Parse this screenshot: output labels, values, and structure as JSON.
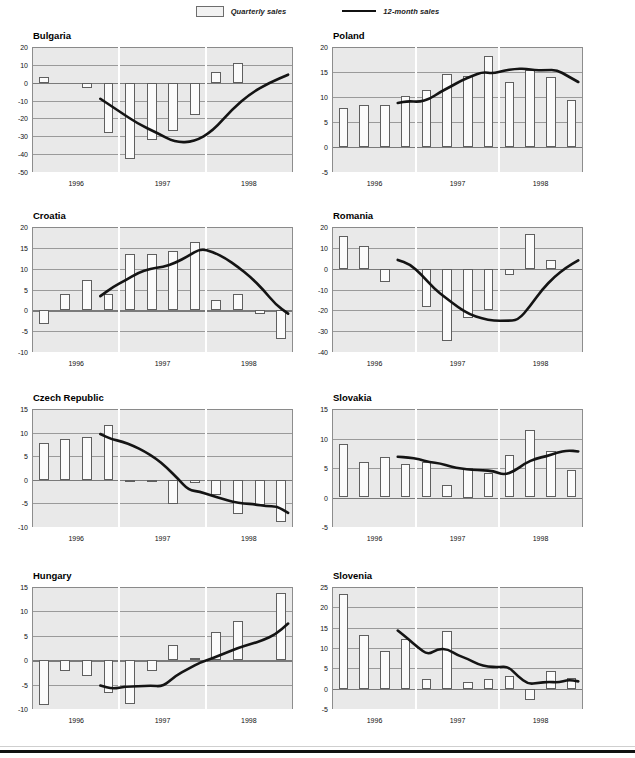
{
  "legend": {
    "items": [
      {
        "name": "bar-swatch",
        "label": "Quarterly sales"
      },
      {
        "name": "line-swatch",
        "label": "12-month sales"
      }
    ]
  },
  "xaxis": {
    "year_labels": [
      "1996",
      "1997",
      "1998"
    ]
  },
  "chart_data": [
    {
      "type": "bar",
      "id": "bulgaria",
      "title": "Bulgaria",
      "xlabel": "",
      "ylabel": "",
      "ylim": [
        -50,
        20
      ],
      "yticks": [
        20,
        10,
        0,
        -10,
        -20,
        -30,
        -40,
        -50
      ],
      "ytick_labels": [
        "20",
        "10",
        "0",
        "-10",
        "-20",
        "-30",
        "-40",
        "-50"
      ],
      "grid": true,
      "legend_position": "top-center",
      "categories": [
        "1996Q1",
        "1996Q2",
        "1996Q3",
        "1996Q4",
        "1997Q1",
        "1997Q2",
        "1997Q3",
        "1997Q4",
        "1998Q1",
        "1998Q2",
        "1998Q3",
        "1998Q4"
      ],
      "series": [
        {
          "name": "Quarterly sales",
          "type": "bar",
          "values": [
            3.0,
            0.0,
            -3.0,
            -28.0,
            -43.0,
            -32.0,
            -27.0,
            -18.0,
            6.0,
            11.0,
            0.0,
            0.0
          ]
        },
        {
          "name": "12-month sales",
          "type": "line",
          "x": [
            "1996Q4",
            "1997Q1",
            "1997Q2",
            "1997Q3",
            "1997Q4",
            "1998Q1",
            "1998Q2",
            "1998Q3",
            "1998Q4"
          ],
          "values": [
            -9.0,
            -16.0,
            -23.0,
            -28.0,
            -33.5,
            -33.0,
            -27.0,
            -15.0,
            -6.0,
            0.0,
            4.5
          ]
        }
      ]
    },
    {
      "type": "bar",
      "id": "poland",
      "title": "Poland",
      "xlabel": "",
      "ylabel": "",
      "ylim": [
        -5,
        20
      ],
      "yticks": [
        20,
        15,
        10,
        5,
        0,
        -5
      ],
      "ytick_labels": [
        "20",
        "15",
        "10",
        "5",
        "0",
        "-5"
      ],
      "grid": true,
      "legend_position": "top-center",
      "categories": [
        "1996Q1",
        "1996Q2",
        "1996Q3",
        "1996Q4",
        "1997Q1",
        "1997Q2",
        "1997Q3",
        "1997Q4",
        "1998Q1",
        "1998Q2",
        "1998Q3",
        "1998Q4"
      ],
      "series": [
        {
          "name": "Quarterly sales",
          "type": "bar",
          "values": [
            7.8,
            8.5,
            8.4,
            10.3,
            11.5,
            14.7,
            14.3,
            18.3,
            13.0,
            15.5,
            14.1,
            9.5
          ]
        },
        {
          "name": "12-month sales",
          "type": "line",
          "values": [
            8.8,
            9.2,
            9.0,
            9.6,
            11.0,
            12.1,
            13.3,
            14.2,
            15.0,
            14.7,
            15.3,
            15.6,
            15.7,
            15.3,
            15.4,
            15.4,
            14.2,
            13.0
          ]
        }
      ]
    },
    {
      "type": "bar",
      "id": "croatia",
      "title": "Croatia",
      "xlabel": "",
      "ylabel": "",
      "ylim": [
        -10,
        20
      ],
      "yticks": [
        20,
        15,
        10,
        5,
        0,
        -5,
        -10
      ],
      "ytick_labels": [
        "20",
        "15",
        "10",
        "5",
        "0",
        "-5",
        "-10"
      ],
      "grid": true,
      "legend_position": "top-center",
      "categories": [
        "1996Q1",
        "1996Q2",
        "1996Q3",
        "1996Q4",
        "1997Q1",
        "1997Q2",
        "1997Q3",
        "1997Q4",
        "1998Q1",
        "1998Q2",
        "1998Q3",
        "1998Q4"
      ],
      "series": [
        {
          "name": "Quarterly sales",
          "type": "bar",
          "values": [
            -3.2,
            4.0,
            7.4,
            4.0,
            13.5,
            13.6,
            14.2,
            16.5,
            2.4,
            3.9,
            -0.8,
            -6.8
          ]
        },
        {
          "name": "12-month sales",
          "type": "line",
          "values": [
            3.4,
            5.6,
            7.2,
            9.0,
            10.0,
            10.4,
            11.4,
            13.0,
            14.8,
            14.0,
            12.5,
            10.4,
            8.0,
            5.0,
            1.4,
            -0.8
          ]
        }
      ]
    },
    {
      "type": "bar",
      "id": "romania",
      "title": "Romania",
      "xlabel": "",
      "ylabel": "",
      "ylim": [
        -40,
        20
      ],
      "yticks": [
        20,
        10,
        0,
        -10,
        -20,
        -30,
        -40
      ],
      "ytick_labels": [
        "20",
        "10",
        "0",
        "-10",
        "-20",
        "-30",
        "-40"
      ],
      "grid": true,
      "legend_position": "top-center",
      "categories": [
        "1996Q1",
        "1996Q2",
        "1996Q3",
        "1996Q4",
        "1997Q1",
        "1997Q2",
        "1997Q3",
        "1997Q4",
        "1998Q1",
        "1998Q2",
        "1998Q3",
        "1998Q4"
      ],
      "series": [
        {
          "name": "Quarterly sales",
          "type": "bar",
          "values": [
            15.8,
            10.7,
            -6.3,
            0.0,
            -18.5,
            -34.5,
            -23.5,
            -20.0,
            -3.0,
            16.8,
            4.0,
            0.0
          ]
        },
        {
          "name": "12-month sales",
          "type": "line",
          "values": [
            4.2,
            2.2,
            -3.0,
            -9.5,
            -14.0,
            -18.5,
            -22.0,
            -24.0,
            -25.0,
            -25.0,
            -24.8,
            -18.0,
            -10.0,
            -4.0,
            0.5,
            4.0
          ]
        }
      ]
    },
    {
      "type": "bar",
      "id": "czech-republic",
      "title": "Czech Republic",
      "xlabel": "",
      "ylabel": "",
      "ylim": [
        -10,
        15
      ],
      "yticks": [
        15,
        10,
        5,
        0,
        -5,
        -10
      ],
      "ytick_labels": [
        "15",
        "10",
        "5",
        "0",
        "-5",
        "-10"
      ],
      "grid": true,
      "legend_position": "top-center",
      "categories": [
        "1996Q1",
        "1996Q2",
        "1996Q3",
        "1996Q4",
        "1997Q1",
        "1997Q2",
        "1997Q3",
        "1997Q4",
        "1998Q1",
        "1998Q2",
        "1998Q3",
        "1998Q4"
      ],
      "series": [
        {
          "name": "Quarterly sales",
          "type": "bar",
          "values": [
            7.9,
            8.7,
            9.1,
            11.7,
            -0.3,
            -0.3,
            -5.1,
            -0.7,
            -3.2,
            -7.3,
            -5.3,
            -8.9
          ]
        },
        {
          "name": "12-month sales",
          "type": "line",
          "values": [
            9.7,
            8.6,
            8.1,
            7.2,
            6.0,
            4.6,
            2.6,
            0.3,
            -2.2,
            -2.5,
            -3.3,
            -4.0,
            -4.7,
            -5.0,
            -5.2,
            -5.6,
            -5.6,
            -7.0
          ]
        }
      ]
    },
    {
      "type": "bar",
      "id": "slovakia",
      "title": "Slovakia",
      "xlabel": "",
      "ylabel": "",
      "ylim": [
        -5,
        15
      ],
      "yticks": [
        15,
        10,
        5,
        0,
        -5
      ],
      "ytick_labels": [
        "15",
        "10",
        "5",
        "0",
        "-5"
      ],
      "grid": true,
      "legend_position": "top-center",
      "categories": [
        "1996Q1",
        "1996Q2",
        "1996Q3",
        "1996Q4",
        "1997Q1",
        "1997Q2",
        "1997Q3",
        "1997Q4",
        "1998Q1",
        "1998Q2",
        "1998Q3",
        "1998Q4"
      ],
      "series": [
        {
          "name": "Quarterly sales",
          "type": "bar",
          "values": [
            9.1,
            6.0,
            6.8,
            5.7,
            6.1,
            2.1,
            5.0,
            4.2,
            7.2,
            11.5,
            7.8,
            4.6
          ]
        },
        {
          "name": "12-month sales",
          "type": "line",
          "values": [
            6.9,
            6.8,
            6.5,
            6.0,
            5.8,
            5.2,
            4.9,
            4.7,
            4.6,
            4.5,
            3.8,
            4.5,
            5.8,
            6.6,
            7.0,
            7.6,
            8.0,
            7.8
          ]
        }
      ]
    },
    {
      "type": "bar",
      "id": "hungary",
      "title": "Hungary",
      "xlabel": "",
      "ylabel": "",
      "ylim": [
        -10,
        15
      ],
      "yticks": [
        15,
        10,
        5,
        0,
        -5,
        -10
      ],
      "ytick_labels": [
        "15",
        "10",
        "5",
        "0",
        "-5",
        "-10"
      ],
      "grid": true,
      "legend_position": "top-center",
      "categories": [
        "1996Q1",
        "1996Q2",
        "1996Q3",
        "1996Q4",
        "1997Q1",
        "1997Q2",
        "1997Q3",
        "1997Q4",
        "1998Q1",
        "1998Q2",
        "1998Q3",
        "1998Q4"
      ],
      "series": [
        {
          "name": "Quarterly sales",
          "type": "bar",
          "values": [
            -9.1,
            -2.2,
            -3.2,
            -6.7,
            -9.0,
            -2.2,
            3.1,
            0.4,
            5.8,
            8.1,
            0.0,
            13.8
          ]
        },
        {
          "name": "12-month sales",
          "type": "line",
          "values": [
            -5.2,
            -5.9,
            -5.4,
            -5.4,
            -5.2,
            -5.4,
            -3.2,
            -1.8,
            -0.4,
            0.4,
            1.5,
            2.5,
            3.3,
            4.1,
            5.3,
            7.5
          ]
        }
      ]
    },
    {
      "type": "bar",
      "id": "slovenia",
      "title": "Slovenia",
      "xlabel": "",
      "ylabel": "",
      "ylim": [
        -5,
        25
      ],
      "yticks": [
        25,
        20,
        15,
        10,
        5,
        0,
        -5
      ],
      "ytick_labels": [
        "25",
        "20",
        "15",
        "10",
        "5",
        "0",
        "-5"
      ],
      "grid": true,
      "legend_position": "top-center",
      "categories": [
        "1996Q1",
        "1996Q2",
        "1996Q3",
        "1996Q4",
        "1997Q1",
        "1997Q2",
        "1997Q3",
        "1997Q4",
        "1998Q1",
        "1998Q2",
        "1998Q3",
        "1998Q4"
      ],
      "series": [
        {
          "name": "Quarterly sales",
          "type": "bar",
          "values": [
            23.2,
            13.3,
            9.2,
            12.2,
            2.4,
            14.3,
            1.7,
            2.3,
            3.0,
            -2.8,
            4.3,
            2.7
          ]
        },
        {
          "name": "12-month sales",
          "type": "line",
          "values": [
            14.3,
            12.3,
            10.2,
            8.3,
            9.8,
            9.7,
            8.2,
            7.3,
            6.0,
            5.4,
            5.3,
            5.5,
            3.0,
            1.1,
            1.4,
            1.7,
            1.5,
            2.2,
            1.8
          ]
        }
      ]
    }
  ]
}
